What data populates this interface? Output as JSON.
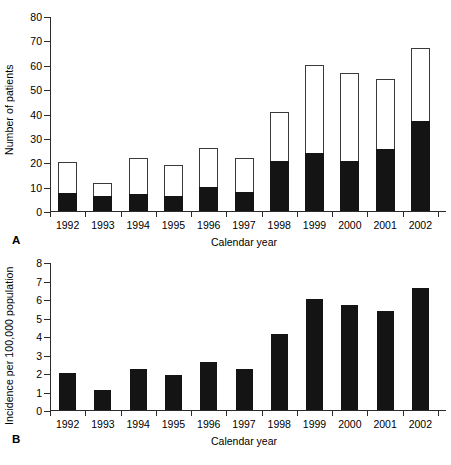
{
  "figure": {
    "panels": [
      "A",
      "B"
    ]
  },
  "panel_a": {
    "letter": "A",
    "ylabel": "Number of patients",
    "xlabel": "Calendar year"
  },
  "panel_b": {
    "letter": "B",
    "ylabel": "Incidence per 100,000 population",
    "xlabel": "Calendar year"
  },
  "chart_data": [
    {
      "type": "bar",
      "panel": "A",
      "stacked": true,
      "title": "",
      "xlabel": "Calendar year",
      "ylabel": "Number of patients",
      "categories": [
        "1992",
        "1993",
        "1994",
        "1995",
        "1996",
        "1997",
        "1998",
        "1999",
        "2000",
        "2001",
        "2002"
      ],
      "ylim": [
        0,
        80
      ],
      "yticks": [
        0,
        10,
        20,
        30,
        40,
        50,
        60,
        70,
        80
      ],
      "ytick_labels": [
        "0",
        "10",
        "20",
        "30",
        "40",
        "50",
        "60",
        "70",
        "80"
      ],
      "grid": false,
      "legend": "none",
      "series": [
        {
          "name": "lower-segment-filled",
          "color": "#141414",
          "values": [
            7.3,
            6.2,
            7.0,
            6.0,
            9.8,
            8.0,
            20.6,
            23.8,
            20.5,
            25.6,
            36.8
          ]
        },
        {
          "name": "upper-segment-open",
          "color": "#ffffff",
          "values": [
            12.7,
            5.4,
            14.8,
            13.0,
            16.1,
            13.6,
            20.1,
            36.2,
            36.1,
            28.4,
            29.9
          ]
        }
      ],
      "totals": [
        20.0,
        11.6,
        21.8,
        19.0,
        25.9,
        21.6,
        40.7,
        60.0,
        56.6,
        54.0,
        66.7
      ]
    },
    {
      "type": "bar",
      "panel": "B",
      "stacked": false,
      "title": "",
      "xlabel": "Calendar year",
      "ylabel": "Incidence per 100,000 population",
      "categories": [
        "1992",
        "1993",
        "1994",
        "1995",
        "1996",
        "1997",
        "1998",
        "1999",
        "2000",
        "2001",
        "2002"
      ],
      "values": [
        2.0,
        1.1,
        2.2,
        1.9,
        2.6,
        2.2,
        4.1,
        6.0,
        5.65,
        5.35,
        6.6
      ],
      "ylim": [
        0,
        8
      ],
      "yticks": [
        0,
        1,
        2,
        3,
        4,
        5,
        6,
        7,
        8
      ],
      "ytick_labels": [
        "0",
        "1",
        "2",
        "3",
        "4",
        "5",
        "6",
        "7",
        "8"
      ],
      "grid": false,
      "legend": "none",
      "bar_color": "#141414"
    }
  ]
}
